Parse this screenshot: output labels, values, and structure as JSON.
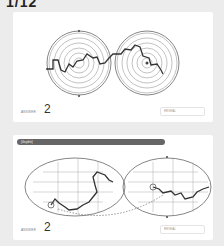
{
  "page": {
    "title": "1/12"
  },
  "puzzles": [
    {
      "type": "circular-maze-pair",
      "answer_label": "ANSWER",
      "answer_value": "2",
      "reveal_label": "REVEAL"
    },
    {
      "type": "elliptical-maze-pair",
      "banner": "[illegible]",
      "answer_label": "ANSWER",
      "answer_value": "2",
      "reveal_label": "REVEAL"
    }
  ],
  "colors": {
    "background": "#ececec",
    "card": "#ffffff",
    "path": "#333333",
    "walls": "#888888",
    "banner": "#666666"
  }
}
